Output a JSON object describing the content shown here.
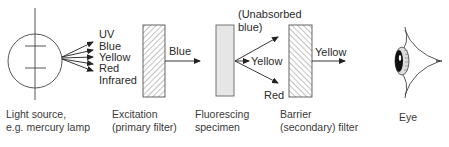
{
  "diagram": {
    "title": "",
    "light_source": {
      "caption_line1": "Light source,",
      "caption_line2": "e.g. mercury lamp",
      "emitted": [
        "UV",
        "Blue",
        "Yellow",
        "Red",
        "Infrared"
      ]
    },
    "excitation_filter": {
      "caption_line1": "Excitation",
      "caption_line2": "(primary filter)",
      "output_label": "Blue"
    },
    "specimen": {
      "caption_line1": "Fluorescing",
      "caption_line2": "specimen",
      "outputs": {
        "unabsorbed_line1": "(Unabsorbed",
        "unabsorbed_line2": "blue)",
        "yellow": "Yellow",
        "red": "Red"
      }
    },
    "barrier_filter": {
      "caption_line1": "Barrier",
      "caption_line2": "(secondary) filter",
      "output_label": "Yellow"
    },
    "eye": {
      "caption": "Eye"
    },
    "colors": {
      "line": "#333333",
      "specimen_fill": "#e6e6e6",
      "hatch": "#666666"
    }
  }
}
